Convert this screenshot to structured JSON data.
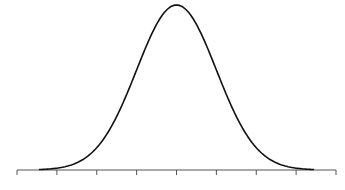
{
  "chart_data": {
    "type": "line",
    "title": "",
    "xlabel": "",
    "ylabel": "",
    "series": [
      {
        "name": "normal-density",
        "mean": 0,
        "sd": 1,
        "color": "#111111"
      }
    ],
    "x_ticks": [
      -4,
      -3,
      -2,
      -1,
      0,
      1,
      2,
      3,
      4
    ],
    "x_tick_labels": [
      "",
      "",
      "",
      "",
      "",
      "",
      "",
      "",
      ""
    ],
    "xlim": [
      -4,
      4
    ],
    "ylim": [
      0,
      0.4
    ],
    "grid": false,
    "legend": "none"
  },
  "layout": {
    "axis_color": "#555555",
    "curve_color": "#111111"
  }
}
